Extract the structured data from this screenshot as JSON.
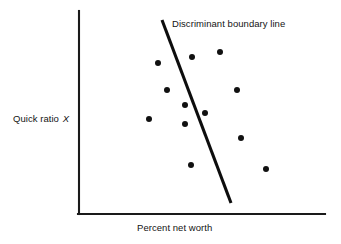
{
  "figure": {
    "background_color": "#ffffff",
    "ink_color": "#111111"
  },
  "labels": {
    "y_axis_prefix": "Quick ratio ",
    "y_axis_variable": "X",
    "x_axis": "Percent net worth",
    "boundary": "Discriminant boundary line"
  },
  "chart_data": {
    "type": "scatter",
    "title": "",
    "xlabel": "Percent net worth",
    "ylabel": "Quick ratio X",
    "grid": false,
    "legend": false,
    "axis_ticks": false,
    "xlim": [
      79,
      325
    ],
    "ylim": [
      11,
      214
    ],
    "annotations": [
      {
        "text": "Discriminant boundary line",
        "x": 172,
        "y": 26
      }
    ],
    "boundary_line": {
      "name": "Discriminant boundary line",
      "x1": 162,
      "y1": 20,
      "x2": 231,
      "y2": 203,
      "color": "#0d0d0d",
      "width": 3.1
    },
    "points": [
      {
        "x": 158,
        "y": 63,
        "side": "left"
      },
      {
        "x": 149,
        "y": 119,
        "side": "left"
      },
      {
        "x": 167,
        "y": 90,
        "side": "left"
      },
      {
        "x": 185,
        "y": 105,
        "side": "left"
      },
      {
        "x": 185,
        "y": 124,
        "side": "left"
      },
      {
        "x": 191,
        "y": 165,
        "side": "left"
      },
      {
        "x": 192,
        "y": 57,
        "side": "right"
      },
      {
        "x": 205,
        "y": 113,
        "side": "right"
      },
      {
        "x": 220,
        "y": 52,
        "side": "right"
      },
      {
        "x": 237,
        "y": 90,
        "side": "right"
      },
      {
        "x": 241,
        "y": 138,
        "side": "right"
      },
      {
        "x": 266,
        "y": 169,
        "side": "right"
      }
    ],
    "point_radius": 3.0,
    "point_color": "#111111"
  },
  "axes": {
    "y_axis": {
      "x1": 79,
      "y1": 11,
      "x2": 79,
      "y2": 214
    },
    "x_axis": {
      "x1": 79,
      "y1": 214,
      "x2": 325,
      "y2": 214
    }
  }
}
